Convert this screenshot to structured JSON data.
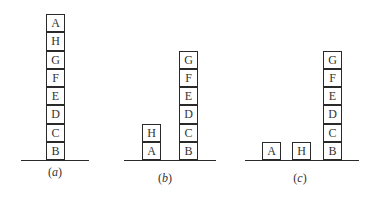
{
  "diagram": {
    "type": "blocks-world",
    "panels": [
      {
        "id": "a",
        "caption": "a",
        "stacks": [
          {
            "blocks_bottom_to_top": [
              "B",
              "C",
              "D",
              "E",
              "F",
              "G",
              "H",
              "A"
            ]
          }
        ]
      },
      {
        "id": "b",
        "caption": "b",
        "stacks": [
          {
            "blocks_bottom_to_top": [
              "A",
              "H"
            ]
          },
          {
            "blocks_bottom_to_top": [
              "B",
              "C",
              "D",
              "E",
              "F",
              "G"
            ]
          }
        ]
      },
      {
        "id": "c",
        "caption": "c",
        "stacks": [
          {
            "blocks_bottom_to_top": [
              "A"
            ]
          },
          {
            "blocks_bottom_to_top": [
              "H"
            ]
          },
          {
            "blocks_bottom_to_top": [
              "B",
              "C",
              "D",
              "E",
              "F",
              "G"
            ]
          }
        ]
      }
    ]
  }
}
